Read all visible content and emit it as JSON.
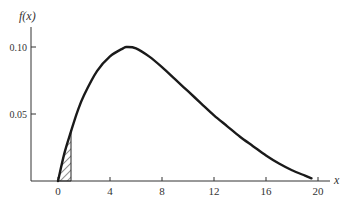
{
  "chart_data": {
    "type": "line",
    "title": "",
    "xlabel": "x",
    "ylabel": "f(x)",
    "xlim": [
      0,
      20.5
    ],
    "ylim": [
      0,
      0.11
    ],
    "x_ticks": [
      0,
      4,
      8,
      12,
      16,
      20
    ],
    "x_tick_labels": [
      "0",
      "4",
      "8",
      "12",
      "16",
      "20"
    ],
    "y_ticks": [
      0.05,
      0.1
    ],
    "y_tick_labels": [
      "0.05",
      "0.10"
    ],
    "grid": false,
    "legend": null,
    "series": [
      {
        "name": "f(x)",
        "x": [
          0,
          0.5,
          1,
          1.5,
          2,
          3,
          4,
          5,
          5.3,
          6,
          7,
          8,
          9,
          10,
          11,
          12,
          13,
          14,
          15,
          16,
          17,
          18,
          19,
          19.5
        ],
        "y": [
          0,
          0.021,
          0.037,
          0.052,
          0.064,
          0.082,
          0.093,
          0.099,
          0.1,
          0.099,
          0.093,
          0.085,
          0.076,
          0.067,
          0.058,
          0.049,
          0.041,
          0.033,
          0.026,
          0.019,
          0.013,
          0.008,
          0.004,
          0.002
        ]
      }
    ],
    "shaded_region": {
      "x_from": 0,
      "x_to": 1,
      "pattern": "hatched",
      "under": "f(x)"
    }
  },
  "colors": {
    "curve": "#1a1a1a",
    "axis": "#333333",
    "background": "#ffffff"
  }
}
